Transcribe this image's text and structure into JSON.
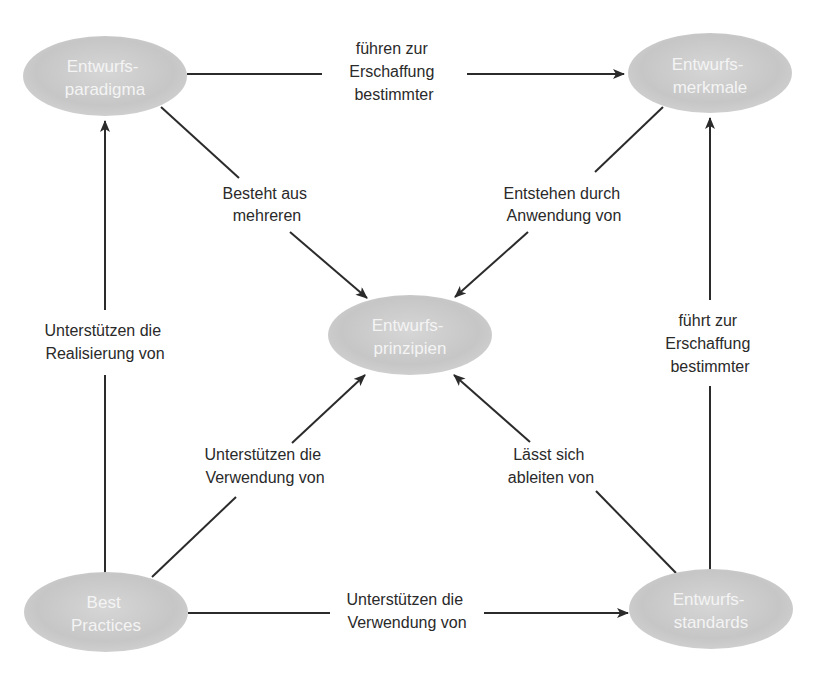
{
  "diagram": {
    "colors": {
      "node_fill": "#c8c8c8",
      "node_fill_light": "#dcdcdc",
      "node_text": "#f4f4f4",
      "edge": "#2b2b2b",
      "label_text": "#2a2a2a",
      "background": "#ffffff"
    },
    "nodes": {
      "paradigma": {
        "line1": "Entwurfs-",
        "line2": "paradigma"
      },
      "merkmale": {
        "line1": "Entwurfs-",
        "line2": "merkmale"
      },
      "prinzipien": {
        "line1": "Entwurfs-",
        "line2": "prinzipien"
      },
      "best_practices": {
        "line1": "Best",
        "line2": "Practices"
      },
      "standards": {
        "line1": "Entwurfs-",
        "line2": "standards"
      }
    },
    "edges": {
      "paradigma_to_merkmale": {
        "line1": "führen zur",
        "line2": "Erschaffung",
        "line3": "bestimmter"
      },
      "paradigma_to_prinzipien": {
        "line1": "Besteht aus",
        "line2": "mehreren"
      },
      "merkmale_to_prinzipien": {
        "line1": "Entstehen durch",
        "line2": "Anwendung von"
      },
      "best_practices_to_paradigma": {
        "line1": "Unterstützen die",
        "line2": "Realisierung von"
      },
      "standards_to_merkmale": {
        "line1": "führt zur",
        "line2": "Erschaffung",
        "line3": "bestimmter"
      },
      "best_practices_to_prinzipien": {
        "line1": "Unterstützen die",
        "line2": "Verwendung von"
      },
      "standards_to_prinzipien": {
        "line1": "Lässt sich",
        "line2": "ableiten von"
      },
      "best_practices_to_standards": {
        "line1": "Unterstützen die",
        "line2": "Verwendung von"
      }
    }
  }
}
